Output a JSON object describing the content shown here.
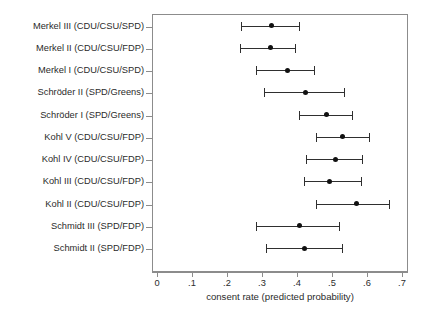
{
  "chart_data": {
    "type": "scatter",
    "title": "",
    "subtitle": "",
    "xlabel": "consent rate (predicted probability)",
    "ylabel": "",
    "xlim": [
      0,
      0.7
    ],
    "xticks": [
      0,
      0.1,
      0.2,
      0.3,
      0.4,
      0.5,
      0.6,
      0.7
    ],
    "xticklabels": [
      "0",
      ".1",
      ".2",
      ".3",
      ".4",
      ".5",
      ".6",
      ".7"
    ],
    "grid": false,
    "legend": null,
    "orientation": "horizontal",
    "error_bars": "95% confidence interval (capped)",
    "marker": "filled-circle",
    "marker_color": "#111111",
    "line_color": "#2f2f2f",
    "frame_color": "#8c8c8c",
    "categories": [
      "Merkel III (CDU/CSU/SPD)",
      "Merkel II (CDU/CSU/FDP)",
      "Merkel I (CDU/CSU/SPD)",
      "Schröder II (SPD/Greens)",
      "Schröder I (SPD/Greens)",
      "Kohl V (CDU/CSU/FDP)",
      "Kohl IV (CDU/CSU/FDP)",
      "Kohl III (CDU/CSU/FDP)",
      "Kohl II (CDU/CSU/FDP)",
      "Schmidt III (SPD/FDP)",
      "Schmidt II (SPD/FDP)"
    ],
    "values": [
      0.326,
      0.323,
      0.374,
      0.423,
      0.483,
      0.531,
      0.511,
      0.494,
      0.569,
      0.406,
      0.42
    ],
    "ci_low": [
      0.24,
      0.237,
      0.283,
      0.306,
      0.406,
      0.454,
      0.426,
      0.42,
      0.454,
      0.283,
      0.311
    ],
    "ci_high": [
      0.406,
      0.394,
      0.449,
      0.534,
      0.557,
      0.606,
      0.586,
      0.583,
      0.663,
      0.52,
      0.529
    ],
    "points": [
      {
        "category": "Merkel III (CDU/CSU/SPD)",
        "value": 0.326,
        "ci_low": 0.24,
        "ci_high": 0.406
      },
      {
        "category": "Merkel II (CDU/CSU/FDP)",
        "value": 0.323,
        "ci_low": 0.237,
        "ci_high": 0.394
      },
      {
        "category": "Merkel I (CDU/CSU/SPD)",
        "value": 0.374,
        "ci_low": 0.283,
        "ci_high": 0.449
      },
      {
        "category": "Schröder II (SPD/Greens)",
        "value": 0.423,
        "ci_low": 0.306,
        "ci_high": 0.534
      },
      {
        "category": "Schröder I (SPD/Greens)",
        "value": 0.483,
        "ci_low": 0.406,
        "ci_high": 0.557
      },
      {
        "category": "Kohl V (CDU/CSU/FDP)",
        "value": 0.531,
        "ci_low": 0.454,
        "ci_high": 0.606
      },
      {
        "category": "Kohl IV (CDU/CSU/FDP)",
        "value": 0.511,
        "ci_low": 0.426,
        "ci_high": 0.586
      },
      {
        "category": "Kohl III (CDU/CSU/FDP)",
        "value": 0.494,
        "ci_low": 0.42,
        "ci_high": 0.583
      },
      {
        "category": "Kohl II (CDU/CSU/FDP)",
        "value": 0.569,
        "ci_low": 0.454,
        "ci_high": 0.663
      },
      {
        "category": "Schmidt III (SPD/FDP)",
        "value": 0.406,
        "ci_low": 0.283,
        "ci_high": 0.52
      },
      {
        "category": "Schmidt II (SPD/FDP)",
        "value": 0.42,
        "ci_low": 0.311,
        "ci_high": 0.529
      }
    ]
  }
}
